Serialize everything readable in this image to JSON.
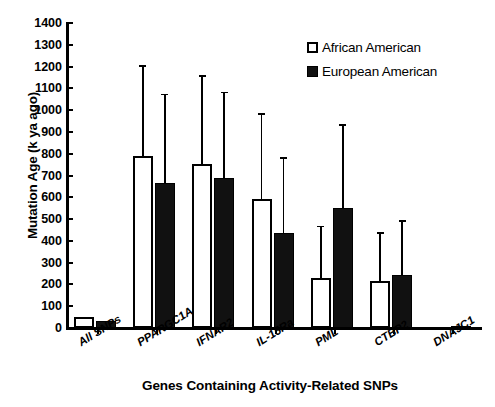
{
  "chart_data": {
    "type": "bar",
    "title": "",
    "xlabel": "Genes Containing Activity-Related SNPs",
    "ylabel": "Mutation Age (k ya ago)",
    "ylim": [
      0,
      1400
    ],
    "ytick_step": 100,
    "yticks": [
      0,
      100,
      200,
      300,
      400,
      500,
      600,
      700,
      800,
      900,
      1000,
      1100,
      1200,
      1300,
      1400
    ],
    "grid": false,
    "legend_position": "top-right",
    "error_bars": "upper-only",
    "categories": [
      "All SNPs",
      "PPARGC1A",
      "IFNAR2",
      "IL-15Ra",
      "PML",
      "CTBP2",
      "DNAJC1"
    ],
    "series": [
      {
        "name": "African American",
        "style": "open",
        "color": "#ffffff",
        "edge_color": "#000000",
        "values": [
          50,
          790,
          755,
          590,
          230,
          215,
          0
        ],
        "error_upper": [
          0,
          1205,
          1160,
          985,
          470,
          440,
          0
        ]
      },
      {
        "name": "European American",
        "style": "filled",
        "color": "#111111",
        "edge_color": "#000000",
        "values": [
          30,
          665,
          690,
          435,
          550,
          245,
          10
        ],
        "error_upper": [
          0,
          1075,
          1085,
          785,
          935,
          495,
          0
        ]
      }
    ]
  },
  "legend": {
    "items": [
      {
        "label": "African American",
        "style": "open"
      },
      {
        "label": "European American",
        "style": "filled"
      }
    ]
  },
  "axes": {
    "y_title": "Mutation Age (k ya ago)",
    "x_title": "Genes Containing Activity-Related SNPs"
  }
}
